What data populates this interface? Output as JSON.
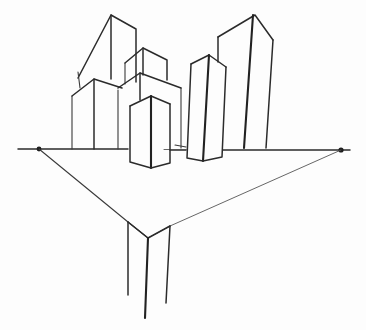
{
  "drawing": {
    "title": "Two-point perspective city sketch",
    "style": "pencil line drawing",
    "colors": {
      "paper": "#fdfdfd",
      "pencil": "#2b2b2b"
    },
    "horizon": {
      "y": 149,
      "x_start": 18,
      "x_end": 350
    },
    "vanishing_points": [
      {
        "name": "left",
        "x": 39,
        "y": 149
      },
      {
        "name": "right",
        "x": 341,
        "y": 150
      }
    ],
    "buildings_above": [
      {
        "name": "tall-left-tower"
      },
      {
        "name": "left-low-block"
      },
      {
        "name": "middle-upper-block"
      },
      {
        "name": "middle-block"
      },
      {
        "name": "front-center-block"
      },
      {
        "name": "right-mid-tower"
      },
      {
        "name": "tall-right-tower"
      }
    ],
    "ground_triangle": {
      "bottom_vertex": {
        "x": 148,
        "y": 238
      }
    },
    "building_below": {
      "name": "below-horizon-column"
    }
  }
}
